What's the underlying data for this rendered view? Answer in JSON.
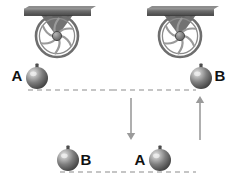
{
  "figure": {
    "background_color": "#ffffff",
    "width": 228,
    "height": 184
  },
  "colors": {
    "beam_fill": "#5a5a5a",
    "beam_top": "#8d8d8d",
    "bracket": "#6a6a6a",
    "wheel_rim": "#6e6e6e",
    "wheel_spoke": "#9a9a9a",
    "rope": "#a9a9a9",
    "ball_dark": "#4b4b4b",
    "ball_mid": "#7c7c7c",
    "ball_light": "#d9d9d9",
    "dashed_line": "#8c8c8c",
    "arrow": "#9b9b9b",
    "label_text": "#111111"
  },
  "panels": [
    {
      "id": "left-panel",
      "name": "initial-state",
      "pulley": {
        "name": "pulley-left",
        "center_x": 57,
        "center_y": 36,
        "radius": 21
      },
      "beam": {
        "name": "ceiling-beam-left",
        "x": 24,
        "y": 6,
        "width": 67,
        "height": 7
      },
      "ropes": [
        {
          "name": "rope-left-strand",
          "x": 37,
          "y1": 36,
          "y2": 68
        },
        {
          "name": "rope-right-strand",
          "x": 78,
          "y1": 36,
          "y2": 148
        }
      ],
      "balls": [
        {
          "name": "ball-a",
          "label": "A",
          "cx": 37,
          "cy": 78,
          "r": 11,
          "label_x": 17,
          "label_y": 81,
          "label_anchor": "middle"
        },
        {
          "name": "ball-b",
          "label": "B",
          "cx": 68,
          "cy": 160,
          "r": 11,
          "label_x": 86,
          "label_y": 165,
          "label_anchor": "middle"
        }
      ],
      "dashed_lines": [
        {
          "name": "level-line-upper-left",
          "x1": 28,
          "x2": 112,
          "y": 90
        },
        {
          "name": "level-line-lower-left",
          "x1": 60,
          "x2": 112,
          "y": 172
        }
      ],
      "arrows": []
    },
    {
      "id": "right-panel",
      "name": "final-state",
      "pulley": {
        "name": "pulley-right",
        "center_x": 180,
        "center_y": 36,
        "radius": 21
      },
      "beam": {
        "name": "ceiling-beam-right",
        "x": 147,
        "y": 6,
        "width": 67,
        "height": 7
      },
      "ropes": [
        {
          "name": "rope-left-strand",
          "x": 160,
          "y1": 36,
          "y2": 150
        },
        {
          "name": "rope-right-strand",
          "x": 201,
          "y1": 36,
          "y2": 68
        }
      ],
      "balls": [
        {
          "name": "ball-b",
          "label": "B",
          "cx": 201,
          "cy": 78,
          "r": 11,
          "label_x": 220,
          "label_y": 81,
          "label_anchor": "middle"
        },
        {
          "name": "ball-a",
          "label": "A",
          "cx": 160,
          "cy": 160,
          "r": 11,
          "label_x": 140,
          "label_y": 165,
          "label_anchor": "middle"
        }
      ],
      "dashed_lines": [
        {
          "name": "level-line-upper-right",
          "x1": 112,
          "x2": 196,
          "y": 90
        },
        {
          "name": "level-line-lower-right",
          "x1": 112,
          "x2": 196,
          "y": 172
        }
      ],
      "arrows": [
        {
          "name": "arrow-down-a",
          "direction": "down",
          "x": 131,
          "y_start": 98,
          "y_end": 140
        },
        {
          "name": "arrow-up-b",
          "direction": "up",
          "x": 200,
          "y_start": 140,
          "y_end": 96
        }
      ]
    }
  ]
}
